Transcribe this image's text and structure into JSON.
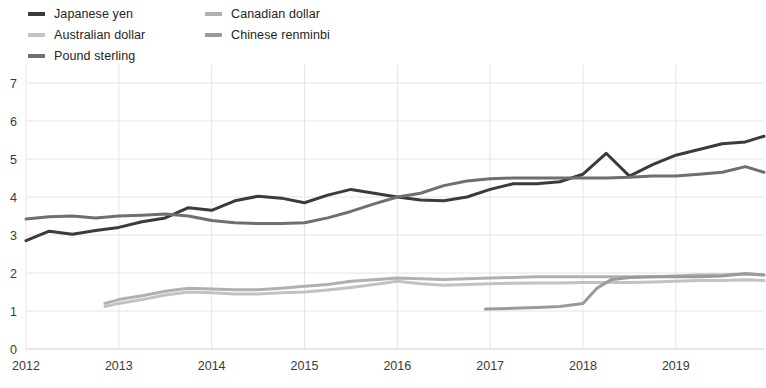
{
  "chart_data": {
    "type": "line",
    "title": "",
    "subtitle": "",
    "xlabel": "",
    "ylabel": "",
    "xlim": [
      2012.0,
      2019.95
    ],
    "ylim": [
      0,
      7
    ],
    "yticks": [
      0,
      1,
      2,
      3,
      4,
      5,
      6,
      7
    ],
    "xticks": [
      2012,
      2013,
      2014,
      2015,
      2016,
      2017,
      2018,
      2019
    ],
    "xtick_labels": [
      "2012",
      "2013",
      "2014",
      "2015",
      "2016",
      "2017",
      "2018",
      "2019"
    ],
    "ytick_labels": [
      "0",
      "1",
      "2",
      "3",
      "4",
      "5",
      "6",
      "7"
    ],
    "grid": true,
    "grid_color": "#e4e4e4",
    "legend_position": "top-left",
    "series": [
      {
        "name": "Japanese yen",
        "color": "#3b3b3b",
        "width": 3.0,
        "x": [
          2012.0,
          2012.25,
          2012.5,
          2012.75,
          2013.0,
          2013.25,
          2013.5,
          2013.75,
          2014.0,
          2014.25,
          2014.5,
          2014.75,
          2015.0,
          2015.25,
          2015.5,
          2015.75,
          2016.0,
          2016.25,
          2016.5,
          2016.75,
          2017.0,
          2017.25,
          2017.5,
          2017.75,
          2018.0,
          2018.25,
          2018.5,
          2018.75,
          2019.0,
          2019.25,
          2019.5,
          2019.75,
          2019.95
        ],
        "values": [
          2.85,
          3.1,
          3.02,
          3.12,
          3.2,
          3.35,
          3.45,
          3.72,
          3.65,
          3.9,
          4.02,
          3.97,
          3.85,
          4.05,
          4.2,
          4.1,
          4.0,
          3.92,
          3.9,
          4.0,
          4.2,
          4.35,
          4.35,
          4.4,
          4.6,
          5.15,
          4.55,
          4.85,
          5.1,
          5.25,
          5.4,
          5.45,
          5.6
        ]
      },
      {
        "name": "Pound sterling",
        "color": "#6f6f6f",
        "width": 3.0,
        "x": [
          2012.0,
          2012.25,
          2012.5,
          2012.75,
          2013.0,
          2013.25,
          2013.5,
          2013.75,
          2014.0,
          2014.25,
          2014.5,
          2014.75,
          2015.0,
          2015.25,
          2015.5,
          2015.75,
          2016.0,
          2016.25,
          2016.5,
          2016.75,
          2017.0,
          2017.25,
          2017.5,
          2017.75,
          2018.0,
          2018.25,
          2018.5,
          2018.75,
          2019.0,
          2019.25,
          2019.5,
          2019.75,
          2019.95
        ],
        "values": [
          3.42,
          3.48,
          3.5,
          3.45,
          3.5,
          3.52,
          3.55,
          3.5,
          3.38,
          3.32,
          3.3,
          3.3,
          3.32,
          3.45,
          3.62,
          3.82,
          4.0,
          4.1,
          4.3,
          4.42,
          4.48,
          4.5,
          4.5,
          4.5,
          4.5,
          4.5,
          4.52,
          4.55,
          4.55,
          4.6,
          4.65,
          4.8,
          4.65
        ]
      },
      {
        "name": "Australian dollar",
        "color": "#c2c2c2",
        "width": 3.0,
        "x": [
          2012.85,
          2013.0,
          2013.25,
          2013.5,
          2013.75,
          2014.0,
          2014.25,
          2014.5,
          2014.75,
          2015.0,
          2015.25,
          2015.5,
          2015.75,
          2016.0,
          2016.25,
          2016.5,
          2016.75,
          2017.0,
          2017.25,
          2017.5,
          2017.75,
          2018.0,
          2018.25,
          2018.5,
          2018.75,
          2019.0,
          2019.25,
          2019.5,
          2019.75,
          2019.95
        ],
        "values": [
          1.12,
          1.2,
          1.3,
          1.42,
          1.5,
          1.48,
          1.45,
          1.45,
          1.48,
          1.5,
          1.55,
          1.62,
          1.7,
          1.78,
          1.72,
          1.68,
          1.7,
          1.72,
          1.73,
          1.74,
          1.74,
          1.75,
          1.75,
          1.75,
          1.76,
          1.78,
          1.8,
          1.8,
          1.82,
          1.8
        ]
      },
      {
        "name": "Canadian dollar",
        "color": "#b0b0b0",
        "width": 3.0,
        "x": [
          2012.85,
          2013.0,
          2013.25,
          2013.5,
          2013.75,
          2014.0,
          2014.25,
          2014.5,
          2014.75,
          2015.0,
          2015.25,
          2015.5,
          2015.75,
          2016.0,
          2016.25,
          2016.5,
          2016.75,
          2017.0,
          2017.25,
          2017.5,
          2017.75,
          2018.0,
          2018.25,
          2018.5,
          2018.75,
          2019.0,
          2019.25,
          2019.5,
          2019.75,
          2019.95
        ],
        "values": [
          1.2,
          1.3,
          1.4,
          1.52,
          1.6,
          1.58,
          1.56,
          1.56,
          1.6,
          1.65,
          1.7,
          1.78,
          1.82,
          1.87,
          1.85,
          1.83,
          1.85,
          1.87,
          1.88,
          1.9,
          1.9,
          1.9,
          1.9,
          1.9,
          1.9,
          1.92,
          1.95,
          1.95,
          1.98,
          1.95
        ]
      },
      {
        "name": "Chinese renminbi",
        "color": "#9a9a9a",
        "width": 3.0,
        "x": [
          2016.95,
          2017.1,
          2017.25,
          2017.5,
          2017.75,
          2018.0,
          2018.15,
          2018.3,
          2018.5,
          2018.75,
          2019.0,
          2019.25,
          2019.5,
          2019.75,
          2019.95
        ],
        "values": [
          1.05,
          1.06,
          1.07,
          1.09,
          1.12,
          1.2,
          1.6,
          1.82,
          1.88,
          1.9,
          1.9,
          1.9,
          1.92,
          1.98,
          1.95
        ]
      }
    ]
  },
  "legend": {
    "columns": [
      {
        "items": [
          {
            "label": "Japanese yen",
            "color": "#3b3b3b"
          },
          {
            "label": "Australian dollar",
            "color": "#c2c2c2"
          },
          {
            "label": "Pound sterling",
            "color": "#6f6f6f"
          }
        ]
      },
      {
        "items": [
          {
            "label": "Canadian dollar",
            "color": "#b0b0b0"
          },
          {
            "label": "Chinese renminbi",
            "color": "#9a9a9a"
          }
        ]
      }
    ]
  }
}
